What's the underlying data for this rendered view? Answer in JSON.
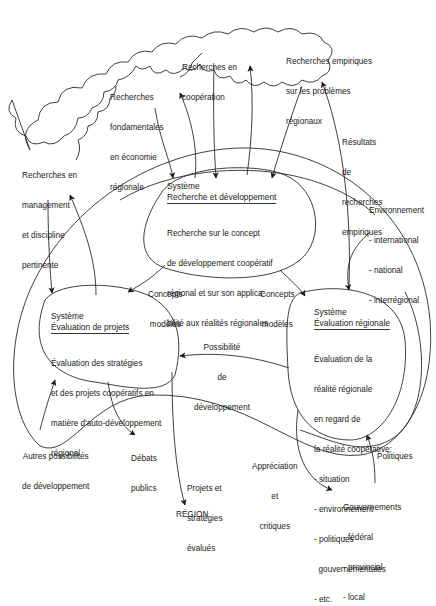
{
  "clouds": [
    {
      "id": "management",
      "lines": [
        "Recherches en",
        "management",
        "et discipline",
        "pertinente"
      ]
    },
    {
      "id": "fondamentales",
      "lines": [
        "Recherches",
        "fondamentales",
        "en économie",
        "régionale"
      ]
    },
    {
      "id": "cooperation",
      "lines": [
        "Recherches en",
        "coopération"
      ]
    },
    {
      "id": "empiriques",
      "lines": [
        "Recherches empiriques",
        "sur les problèmes",
        "régionaux"
      ]
    }
  ],
  "systems": {
    "rd": {
      "label": "Système",
      "title": "Recherche et développement",
      "body": [
        "Recherche sur le concept",
        "de développement coopératif",
        "régional et sur son applica-",
        "bilité aux réalités régionales"
      ]
    },
    "projets": {
      "label": "Système",
      "title": "Évaluation de projets",
      "body": [
        "Évaluation des stratégies",
        "et des projets coopératifs en",
        "matière d'auto-développement",
        "régional"
      ]
    },
    "regionale": {
      "label": "Système",
      "title": "Évaluation régionale",
      "body": [
        "Évaluation de la",
        "réalité régionale",
        "en regard de",
        "la réalité coopérative:"
      ],
      "items": [
        "- situation",
        "- environnement",
        "- politiques",
        "  gouvernementales",
        "- etc."
      ]
    }
  },
  "labels": {
    "resultats": [
      "Résultats",
      "de",
      "recherches",
      "empiriques"
    ],
    "environnement": {
      "title": "Environnement",
      "items": [
        "- international",
        "- national",
        "- interrégional"
      ]
    },
    "concepts_left": [
      "Concepts",
      "modèles"
    ],
    "concepts_right": [
      "Concepts",
      "modèles"
    ],
    "possibilite": [
      "Possibilité",
      "de",
      "développement"
    ],
    "autres": [
      "Autres possibilités",
      "de développement"
    ],
    "debats": [
      "Débats",
      "publics"
    ],
    "projets_evalues": [
      "Projets et",
      "stratégies",
      "évalués"
    ],
    "region": "RÉGION",
    "appreciation": [
      "Appréciation",
      "et",
      "critiques"
    ],
    "politiques": "Politiques",
    "gouvernements": {
      "title": "Gouvernements",
      "items": [
        "- fédéral",
        "- provincial",
        "- local"
      ]
    }
  },
  "colors": {
    "stroke": "#2a2a2a",
    "text": "#1a1a1a",
    "background": "#ffffff"
  }
}
